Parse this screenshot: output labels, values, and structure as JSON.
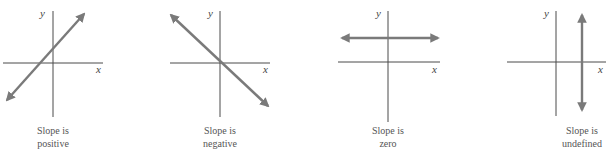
{
  "colors": {
    "axis": "#4a4a4a",
    "line": "#7a7a7a",
    "text": "#555555"
  },
  "panels": [
    {
      "caption_line1": "Slope is",
      "caption_line2": "positive",
      "x_label": "x",
      "y_label": "y"
    },
    {
      "caption_line1": "Slope is",
      "caption_line2": "negative",
      "x_label": "x",
      "y_label": "y"
    },
    {
      "caption_line1": "Slope is",
      "caption_line2": "zero",
      "x_label": "x",
      "y_label": "y"
    },
    {
      "caption_line1": "Slope is",
      "caption_line2": "undefined",
      "x_label": "x",
      "y_label": "y"
    }
  ]
}
